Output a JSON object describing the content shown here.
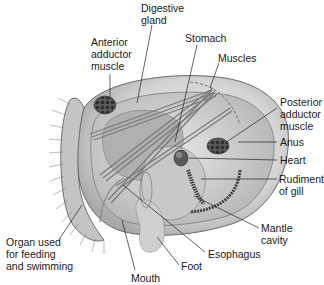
{
  "diagram": {
    "labels": [
      {
        "id": "digestive-gland",
        "text": "Digestive\ngland",
        "x": 141,
        "y": 2
      },
      {
        "id": "anterior-adductor-muscle",
        "text": "Anterior\nadductor\nmuscle",
        "x": 91,
        "y": 36
      },
      {
        "id": "stomach",
        "text": "Stomach",
        "x": 185,
        "y": 32
      },
      {
        "id": "muscles",
        "text": "Muscles",
        "x": 218,
        "y": 52
      },
      {
        "id": "posterior-adductor-muscle",
        "text": "Posterior\nadductor\nmuscle",
        "x": 280,
        "y": 96
      },
      {
        "id": "anus",
        "text": "Anus",
        "x": 280,
        "y": 136
      },
      {
        "id": "heart",
        "text": "Heart",
        "x": 280,
        "y": 154
      },
      {
        "id": "rudiment-of-gill",
        "text": "Rudiment\nof gill",
        "x": 279,
        "y": 173
      },
      {
        "id": "mantle-cavity",
        "text": "Mantle\ncavity",
        "x": 261,
        "y": 222
      },
      {
        "id": "organ-used-for-feeding-and-swimming",
        "text": "Organ used\nfor feeding\nand swimming",
        "x": 6,
        "y": 236
      },
      {
        "id": "esophagus",
        "text": "Esophagus",
        "x": 208,
        "y": 248
      },
      {
        "id": "foot",
        "text": "Foot",
        "x": 181,
        "y": 260
      },
      {
        "id": "mouth",
        "text": "Mouth",
        "x": 131,
        "y": 272
      }
    ]
  },
  "colors": {
    "background": "#ffffff",
    "text": "#1a1a1a",
    "shell": "#d9d9d9",
    "shell_outline": "#6a6a6a",
    "muscle": "#8a8a8a",
    "dark": "#3c3c3c",
    "leader": "#222222"
  }
}
